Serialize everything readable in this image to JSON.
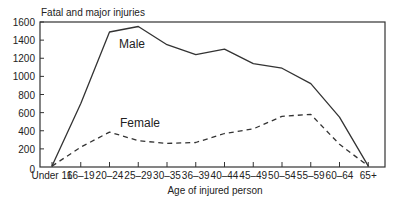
{
  "chart_data": {
    "type": "line",
    "title": "",
    "ylabel": "Fatal and major injuries",
    "xlabel": "Age of injured person",
    "ylim": [
      0,
      1600
    ],
    "yticks": [
      0,
      200,
      400,
      600,
      800,
      1000,
      1200,
      1400,
      1600
    ],
    "grid": false,
    "legend": "inline labels",
    "categories": [
      "Under 16",
      "16–19",
      "20–24",
      "25–29",
      "30–35",
      "36–39",
      "40–44",
      "45–49",
      "50–54",
      "55–59",
      "60–64",
      "65+"
    ],
    "series": [
      {
        "name": "Male",
        "style": "solid",
        "values": [
          10,
          700,
          1490,
          1550,
          1350,
          1240,
          1300,
          1140,
          1090,
          920,
          550,
          10
        ]
      },
      {
        "name": "Female",
        "style": "dashed",
        "values": [
          10,
          220,
          385,
          290,
          260,
          270,
          370,
          420,
          560,
          580,
          250,
          10
        ]
      }
    ]
  },
  "labels": {
    "ylabel": "Fatal and major injuries",
    "xlabel": "Age of injured person",
    "male": "Male",
    "female": "Female"
  }
}
